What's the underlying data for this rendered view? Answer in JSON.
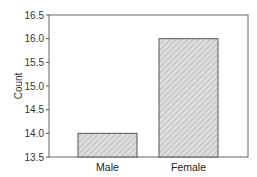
{
  "chart_data": {
    "type": "bar",
    "title": "",
    "xlabel": "",
    "ylabel": "Count",
    "categories": [
      "Male",
      "Female"
    ],
    "values": [
      14.0,
      16.0
    ],
    "ylim": [
      13.5,
      16.5
    ],
    "yticks": [
      13.5,
      14.0,
      14.5,
      15.0,
      15.5,
      16.0,
      16.5
    ],
    "ytick_labels": [
      "13.5",
      "14.0",
      "14.5",
      "15.0",
      "15.5",
      "16.0",
      "16.5"
    ],
    "grid": false,
    "legend": null,
    "bar_fill": "#d6d6d6",
    "bar_hatch": "diagonal",
    "bar_stroke": "#555555"
  }
}
